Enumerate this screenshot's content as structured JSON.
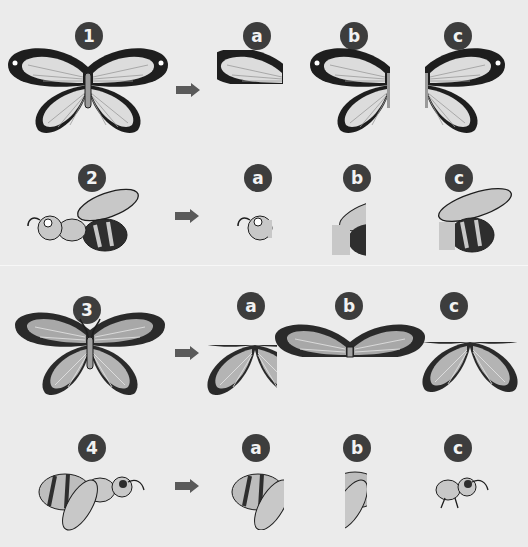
{
  "puzzles": [
    {
      "number": "1",
      "subject": "white butterfly",
      "options": [
        {
          "label": "a",
          "desc": "top-left forewing piece"
        },
        {
          "label": "b",
          "desc": "left half"
        },
        {
          "label": "c",
          "desc": "right half"
        }
      ]
    },
    {
      "number": "2",
      "subject": "wasp",
      "options": [
        {
          "label": "a",
          "desc": "head piece"
        },
        {
          "label": "b",
          "desc": "middle piece"
        },
        {
          "label": "c",
          "desc": "rear half"
        }
      ]
    },
    {
      "number": "3",
      "subject": "grey butterfly",
      "options": [
        {
          "label": "a",
          "desc": "bottom-left piece"
        },
        {
          "label": "b",
          "desc": "top half"
        },
        {
          "label": "c",
          "desc": "bottom half"
        }
      ]
    },
    {
      "number": "4",
      "subject": "bee",
      "options": [
        {
          "label": "a",
          "desc": "rear piece"
        },
        {
          "label": "b",
          "desc": "middle strip"
        },
        {
          "label": "c",
          "desc": "head piece"
        }
      ]
    }
  ],
  "icons": {
    "arrow": "arrow-right-icon"
  },
  "colors": {
    "background": "#ebebeb",
    "badge": "#3d3d3d",
    "badge_text": "#f2f2f2",
    "arrow": "#5a5a5a",
    "outline": "#1e1e1e",
    "wing_light": "#dcdcdc",
    "wing_grey": "#a8a8a8"
  }
}
